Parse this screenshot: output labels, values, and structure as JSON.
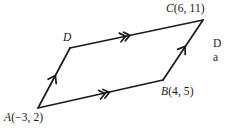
{
  "figure": {
    "kind": "geometry-diagram",
    "shape": "parallelogram",
    "background_color": "#ffffff",
    "stroke_color": "#1a1a1a",
    "text_color": "#1a1a1a",
    "vertices": [
      {
        "id": "A",
        "point_label": "A",
        "coord_label": "(−3, 2)",
        "full_label": "A (−3, 2)",
        "x": -3,
        "y": 2,
        "px": 38,
        "py": 108,
        "label_left": 4,
        "label_top": 112
      },
      {
        "id": "B",
        "point_label": "B",
        "coord_label": "(4, 5)",
        "full_label": "B (4, 5)",
        "x": 4,
        "y": 5,
        "px": 163,
        "py": 80,
        "label_left": 161,
        "label_top": 86
      },
      {
        "id": "C",
        "point_label": "C",
        "coord_label": "(6, 11)",
        "full_label": "C (6, 11)",
        "x": 6,
        "y": 11,
        "px": 203,
        "py": 20,
        "label_left": 166,
        "label_top": 3
      },
      {
        "id": "D",
        "point_label": "D",
        "coord_label": "",
        "full_label": "D",
        "px": 70,
        "py": 48,
        "label_left": 63,
        "label_top": 32
      }
    ],
    "edges": [
      {
        "id": "AB",
        "from": "A",
        "to": "B",
        "marker": "double-chevron",
        "marker_count": 2,
        "direction": "A-to-B"
      },
      {
        "id": "BC",
        "from": "B",
        "to": "C",
        "marker": "single-arrow",
        "marker_count": 1,
        "direction": "B-to-C"
      },
      {
        "id": "DC",
        "from": "D",
        "to": "C",
        "marker": "double-chevron",
        "marker_count": 2,
        "direction": "D-to-C"
      },
      {
        "id": "AD",
        "from": "A",
        "to": "D",
        "marker": "single-arrow",
        "marker_count": 1,
        "direction": "A-to-D"
      }
    ],
    "margin_note": {
      "line1": "D",
      "line2": "a",
      "clipped": true
    }
  }
}
